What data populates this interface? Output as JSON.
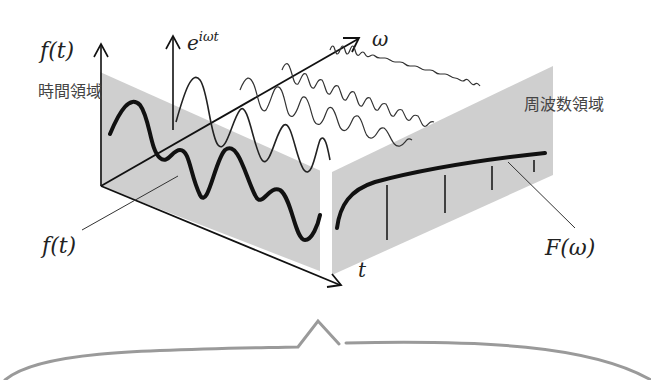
{
  "diagram": {
    "labels": {
      "ft_axis": "f(t)",
      "basis": "e",
      "basis_exp": "iωt",
      "omega_axis": "ω",
      "time_domain": "時間領域",
      "freq_domain": "周波数領域",
      "ft_callout": "f(t)",
      "Fw_callout": "F(ω)",
      "t_axis": "t"
    },
    "colors": {
      "plane_fill": "#cfcfcf",
      "ink": "#111111",
      "thin_wave": "#333333",
      "brace": "#9a9a9a",
      "label_text": "#444444"
    },
    "components": [
      {
        "name": "time-domain-plane",
        "description": "shaded triangular plane containing f(t)"
      },
      {
        "name": "frequency-domain-plane",
        "description": "shaded plane containing spectrum F(ω)"
      },
      {
        "name": "basis-waves",
        "count": 4,
        "description": "sinusoids e^{iωt} of increasing frequency along ω axis"
      },
      {
        "name": "spectrum-lines",
        "count": 5,
        "description": "vertical spectrum amplitude lines"
      },
      {
        "name": "curly-brace",
        "description": "gray brace beneath diagram"
      }
    ]
  }
}
